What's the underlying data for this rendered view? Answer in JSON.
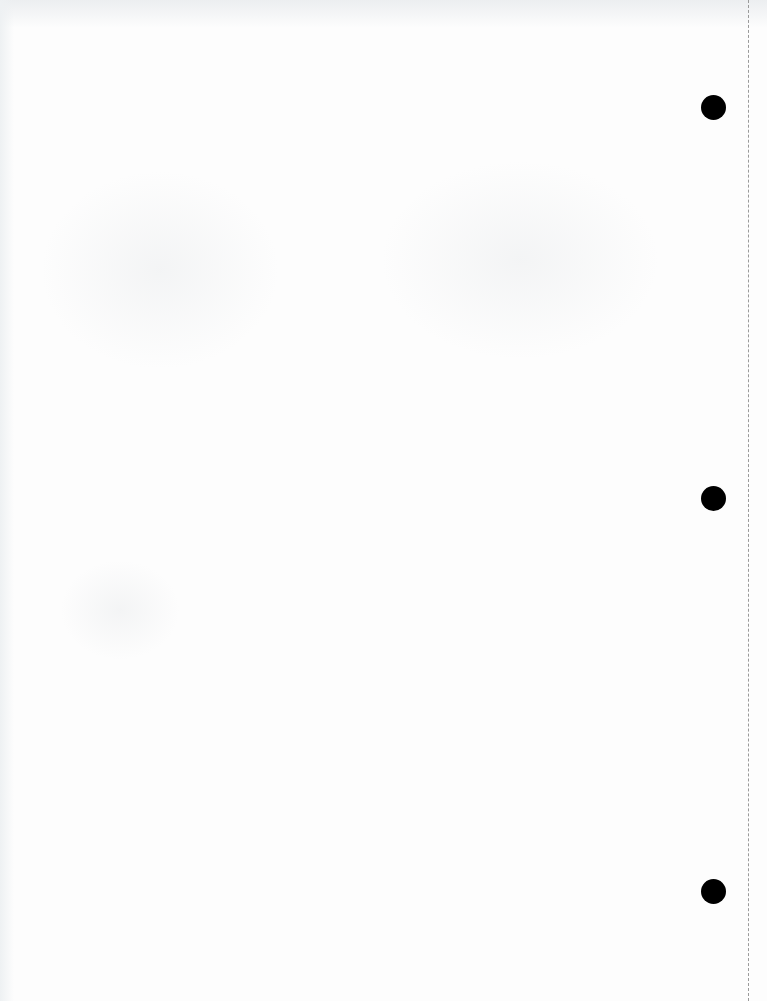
{
  "page": {
    "type": "blank-scanned-sheet",
    "width": 767,
    "height": 1001,
    "background_color": "#fdfdfd",
    "text_content": []
  },
  "punch_holes": [
    {
      "cx": 713,
      "cy": 107,
      "diameter": 25,
      "color": "#000000"
    },
    {
      "cx": 713,
      "cy": 498,
      "diameter": 25,
      "color": "#000000"
    },
    {
      "cx": 713,
      "cy": 891,
      "diameter": 25,
      "color": "#000000"
    }
  ],
  "perforation": {
    "x": 748,
    "style": "dashed",
    "color": "#9a9a9a"
  },
  "bleed_through_regions": [
    {
      "x": 40,
      "y": 170,
      "w": 240,
      "h": 200
    },
    {
      "x": 380,
      "y": 160,
      "w": 280,
      "h": 200
    },
    {
      "x": 60,
      "y": 560,
      "w": 120,
      "h": 100
    }
  ]
}
